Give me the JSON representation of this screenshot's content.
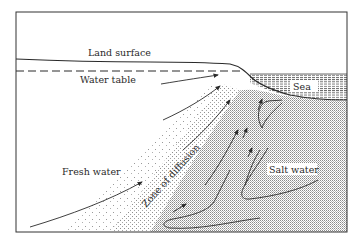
{
  "diagram": {
    "type": "cross-section",
    "labels": {
      "land_surface": "Land surface",
      "water_table": "Water table",
      "sea": "Sea",
      "fresh_water": "Fresh water",
      "zone_of_diffusion": "Zone of diffusion",
      "salt_water": "Salt water"
    },
    "colors": {
      "frame": "#333333",
      "line": "#2a2a2a",
      "background": "#ffffff",
      "salt_fill": "#d8d8d8",
      "sea_hatch": "#555555"
    }
  }
}
